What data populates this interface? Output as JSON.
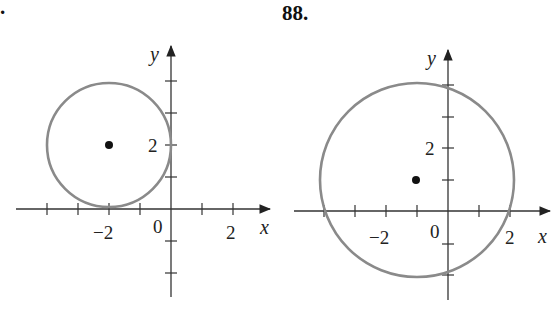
{
  "problems": [
    {
      "number": "87.",
      "number_partial": ".",
      "axis_labels": {
        "x": "x",
        "y": "y"
      },
      "tick_labels": {
        "x_neg": "−2",
        "origin": "0",
        "x_pos": "2",
        "y_pos": "2"
      },
      "circle": {
        "center": [
          -2,
          2
        ],
        "radius": 2,
        "color": "#888888"
      }
    },
    {
      "number": "88.",
      "axis_labels": {
        "x": "x",
        "y": "y"
      },
      "tick_labels": {
        "x_neg": "−2",
        "origin": "0",
        "x_pos": "2",
        "y_pos": "2"
      },
      "circle": {
        "center": [
          -1,
          1
        ],
        "radius": 3.16,
        "color": "#888888"
      }
    }
  ],
  "colors": {
    "axis": "#333333",
    "circle": "#8a8a8a",
    "center_point": "#111111"
  }
}
